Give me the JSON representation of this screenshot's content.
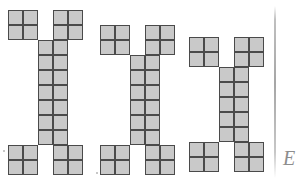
{
  "scene": {
    "title": "Three I-beam polyomino figures",
    "background_color": "#ffffff",
    "width": 307,
    "height": 182
  },
  "style": {
    "cell_size": 15,
    "cell_fill": "#c9c9c9",
    "cell_border": "#4a4a4a",
    "border_width": 1.6
  },
  "figures": [
    {
      "label": "figure-1",
      "origin_x": 8,
      "origin_y": 10,
      "columns": 5,
      "rows": 11,
      "stem_rows": 7,
      "cap_rows": 2,
      "cap_cols": 2,
      "gap_cols": 1,
      "total_cells": 30,
      "occupancy": [
        "11011",
        "11011",
        "00110",
        "00110",
        "00110",
        "00110",
        "00110",
        "00110",
        "00110",
        "11011",
        "11011"
      ]
    },
    {
      "label": "figure-2",
      "origin_x": 100,
      "origin_y": 25,
      "columns": 5,
      "rows": 10,
      "stem_rows": 6,
      "cap_rows": 2,
      "cap_cols": 2,
      "gap_cols": 1,
      "total_cells": 28,
      "occupancy": [
        "11011",
        "11011",
        "00110",
        "00110",
        "00110",
        "00110",
        "00110",
        "00110",
        "11011",
        "11011"
      ]
    },
    {
      "label": "figure-3",
      "origin_x": 189,
      "origin_y": 37,
      "columns": 5,
      "rows": 9,
      "stem_rows": 5,
      "cap_rows": 2,
      "cap_cols": 2,
      "gap_cols": 1,
      "total_cells": 26,
      "occupancy": [
        "11011",
        "11011",
        "00110",
        "00110",
        "00110",
        "00110",
        "00110",
        "11011",
        "11011"
      ]
    }
  ],
  "artifacts": {
    "scanline": {
      "name": "page-edge-line",
      "x": 274,
      "y": 6,
      "width": 2,
      "height": 172,
      "color": "#969696"
    },
    "handwriting": {
      "name": "handwritten-letter",
      "text": "E",
      "x": 283,
      "y": 148,
      "font_size": 20,
      "color": "#8d8d8d"
    },
    "specks": [
      {
        "x": 3,
        "y": 150,
        "size": 2
      },
      {
        "x": 96,
        "y": 172,
        "size": 2
      }
    ]
  }
}
